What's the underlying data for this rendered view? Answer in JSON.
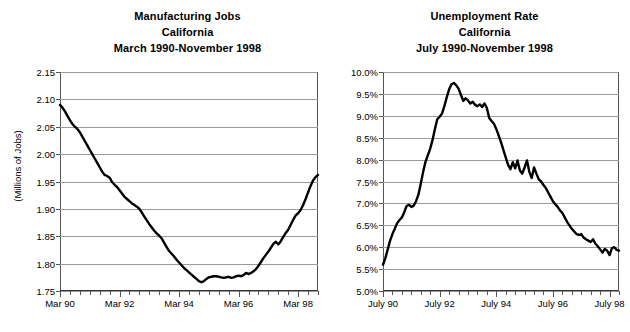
{
  "chart_data": [
    {
      "type": "line",
      "id": "manufacturing-jobs",
      "title": "Manufacturing Jobs",
      "subtitle": "California",
      "subtitle2": "March 1990-November 1998",
      "xlabel": "",
      "ylabel": "(Millions of Jobs)",
      "ylim": [
        1.75,
        2.15
      ],
      "ytick_labels": [
        "2.15",
        "2.10",
        "2.05",
        "2.00",
        "1.95",
        "1.90",
        "1.85",
        "1.80",
        "1.75"
      ],
      "ytick_values": [
        2.15,
        2.1,
        2.05,
        2.0,
        1.95,
        1.9,
        1.85,
        1.8,
        1.75
      ],
      "xtick_labels": [
        "Mar 90",
        "Mar 92",
        "Mar 94",
        "Mar 96",
        "Mar 98"
      ],
      "xtick_values": [
        0,
        24,
        48,
        72,
        96
      ],
      "xlim": [
        0,
        104
      ],
      "grid": true,
      "legend": "none",
      "x": [
        0,
        1,
        2,
        3,
        4,
        5,
        6,
        7,
        8,
        9,
        10,
        11,
        12,
        13,
        14,
        15,
        16,
        17,
        18,
        19,
        20,
        21,
        22,
        23,
        24,
        25,
        26,
        27,
        28,
        29,
        30,
        31,
        32,
        33,
        34,
        35,
        36,
        37,
        38,
        39,
        40,
        41,
        42,
        43,
        44,
        45,
        46,
        47,
        48,
        49,
        50,
        51,
        52,
        53,
        54,
        55,
        56,
        57,
        58,
        59,
        60,
        61,
        62,
        63,
        64,
        65,
        66,
        67,
        68,
        69,
        70,
        71,
        72,
        73,
        74,
        75,
        76,
        77,
        78,
        79,
        80,
        81,
        82,
        83,
        84,
        85,
        86,
        87,
        88,
        89,
        90,
        91,
        92,
        93,
        94,
        95,
        96,
        97,
        98,
        99,
        100,
        101,
        102,
        103,
        104
      ],
      "values": [
        2.09,
        2.085,
        2.078,
        2.07,
        2.062,
        2.055,
        2.05,
        2.046,
        2.04,
        2.032,
        2.024,
        2.016,
        2.008,
        2.0,
        1.992,
        1.984,
        1.976,
        1.968,
        1.962,
        1.96,
        1.957,
        1.949,
        1.944,
        1.94,
        1.934,
        1.928,
        1.922,
        1.918,
        1.914,
        1.91,
        1.907,
        1.904,
        1.9,
        1.893,
        1.886,
        1.879,
        1.872,
        1.866,
        1.86,
        1.855,
        1.851,
        1.846,
        1.838,
        1.83,
        1.823,
        1.818,
        1.813,
        1.807,
        1.802,
        1.797,
        1.792,
        1.788,
        1.784,
        1.78,
        1.776,
        1.772,
        1.768,
        1.766,
        1.768,
        1.772,
        1.775,
        1.776,
        1.777,
        1.777,
        1.776,
        1.775,
        1.774,
        1.775,
        1.776,
        1.774,
        1.775,
        1.777,
        1.778,
        1.777,
        1.779,
        1.783,
        1.781,
        1.783,
        1.786,
        1.79,
        1.796,
        1.803,
        1.81,
        1.816,
        1.822,
        1.829,
        1.836,
        1.84,
        1.835,
        1.841,
        1.849,
        1.856,
        1.862,
        1.871,
        1.88,
        1.888,
        1.892,
        1.898,
        1.907,
        1.918,
        1.93,
        1.942,
        1.952,
        1.958,
        1.962,
        1.958,
        1.965,
        1.959,
        1.967,
        1.962,
        1.968
      ]
    },
    {
      "type": "line",
      "id": "unemployment-rate",
      "title": "Unemployment Rate",
      "subtitle": "California",
      "subtitle2": "July 1990-November 1998",
      "xlabel": "",
      "ylabel": "",
      "ylim": [
        5.0,
        10.0
      ],
      "ytick_labels": [
        "10.0%",
        "9.5%",
        "9.0%",
        "8.5%",
        "8.0%",
        "7.5%",
        "7.0%",
        "6.5%",
        "6.0%",
        "5.5%",
        "5.0%"
      ],
      "ytick_values": [
        10.0,
        9.5,
        9.0,
        8.5,
        8.0,
        7.5,
        7.0,
        6.5,
        6.0,
        5.5,
        5.0
      ],
      "xtick_labels": [
        "July 90",
        "July 92",
        "July 94",
        "July 96",
        "July 98"
      ],
      "xtick_values": [
        0,
        24,
        48,
        72,
        96
      ],
      "xlim": [
        0,
        100
      ],
      "grid": true,
      "legend": "none",
      "x": [
        0,
        1,
        2,
        3,
        4,
        5,
        6,
        7,
        8,
        9,
        10,
        11,
        12,
        13,
        14,
        15,
        16,
        17,
        18,
        19,
        20,
        21,
        22,
        23,
        24,
        25,
        26,
        27,
        28,
        29,
        30,
        31,
        32,
        33,
        34,
        35,
        36,
        37,
        38,
        39,
        40,
        41,
        42,
        43,
        44,
        45,
        46,
        47,
        48,
        49,
        50,
        51,
        52,
        53,
        54,
        55,
        56,
        57,
        58,
        59,
        60,
        61,
        62,
        63,
        64,
        65,
        66,
        67,
        68,
        69,
        70,
        71,
        72,
        73,
        74,
        75,
        76,
        77,
        78,
        79,
        80,
        81,
        82,
        83,
        84,
        85,
        86,
        87,
        88,
        89,
        90,
        91,
        92,
        93,
        94,
        95,
        96,
        97,
        98,
        99,
        100
      ],
      "values": [
        5.6,
        5.75,
        5.95,
        6.15,
        6.3,
        6.42,
        6.55,
        6.62,
        6.68,
        6.8,
        6.94,
        6.97,
        6.92,
        6.95,
        7.05,
        7.2,
        7.45,
        7.72,
        7.95,
        8.1,
        8.25,
        8.45,
        8.7,
        8.92,
        8.98,
        9.05,
        9.22,
        9.42,
        9.6,
        9.72,
        9.75,
        9.7,
        9.62,
        9.48,
        9.34,
        9.4,
        9.35,
        9.28,
        9.32,
        9.25,
        9.22,
        9.26,
        9.2,
        9.28,
        9.18,
        8.95,
        8.88,
        8.82,
        8.7,
        8.55,
        8.4,
        8.22,
        8.05,
        7.88,
        7.78,
        7.94,
        7.8,
        7.98,
        7.75,
        7.68,
        7.82,
        7.98,
        7.72,
        7.58,
        7.82,
        7.68,
        7.55,
        7.5,
        7.42,
        7.35,
        7.25,
        7.15,
        7.05,
        6.98,
        6.92,
        6.84,
        6.78,
        6.68,
        6.58,
        6.5,
        6.42,
        6.36,
        6.3,
        6.28,
        6.3,
        6.22,
        6.18,
        6.15,
        6.12,
        6.18,
        6.08,
        6.02,
        5.95,
        5.88,
        5.96,
        5.92,
        5.82,
        5.98,
        6.0,
        5.94,
        5.92
      ]
    }
  ],
  "page": {
    "background_color": "#ffffff",
    "line_color": "#000000",
    "grid_color": "#9a9a9a",
    "axis_color": "#333333"
  }
}
